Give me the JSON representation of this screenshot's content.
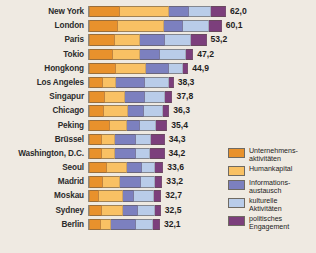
{
  "chart_data": {
    "type": "bar",
    "orientation": "horizontal",
    "stacked": true,
    "title": "",
    "subtitle": "",
    "xlabel": "",
    "ylabel": "",
    "grid": false,
    "xlim": [
      0,
      62
    ],
    "legend_position": "right",
    "value_format": "comma-decimal",
    "categories": [
      "New York",
      "London",
      "Paris",
      "Tokio",
      "Hongkong",
      "Los Angeles",
      "Singapur",
      "Chicago",
      "Peking",
      "Brüssel",
      "Washington, D.C.",
      "Seoul",
      "Madrid",
      "Moskau",
      "Sydney",
      "Berlin"
    ],
    "totals": [
      62.0,
      60.1,
      53.2,
      47.2,
      44.9,
      38.3,
      37.8,
      36.3,
      35.4,
      34.3,
      34.2,
      33.6,
      33.2,
      32.7,
      32.5,
      32.1
    ],
    "total_labels": [
      "62,0",
      "60,1",
      "53,2",
      "47,2",
      "44,9",
      "38,3",
      "37,8",
      "36,3",
      "35,4",
      "34,3",
      "34,2",
      "33,6",
      "33,2",
      "32,7",
      "32,5",
      "32,1"
    ],
    "series": [
      {
        "name": "Unternehmens-\naktivitäten",
        "color": "#e8912c",
        "values": [
          14.2,
          13.0,
          11.6,
          10.8,
          12.0,
          6.4,
          7.2,
          7.0,
          9.3,
          5.9,
          5.8,
          8.1,
          6.4,
          4.6,
          5.7,
          5.6
        ]
      },
      {
        "name": "Humankapital",
        "color": "#f9c164",
        "values": [
          21.9,
          21.1,
          11.4,
          12.3,
          13.9,
          5.9,
          9.3,
          10.5,
          7.7,
          5.7,
          6.0,
          9.1,
          7.5,
          10.8,
          9.5,
          4.3
        ]
      },
      {
        "name": "Informations-\naustausch",
        "color": "#7c80bf",
        "values": [
          9.1,
          8.3,
          11.6,
          9.0,
          10.3,
          13.1,
          9.0,
          7.3,
          5.9,
          9.5,
          9.6,
          6.6,
          9.5,
          5.1,
          7.1,
          11.2
        ]
      },
      {
        "name": "kulturelle\nAktivitäten",
        "color": "#b9cce9",
        "values": [
          10.2,
          12.1,
          11.4,
          11.6,
          6.4,
          11.0,
          9.1,
          8.5,
          7.3,
          7.0,
          6.2,
          6.0,
          6.4,
          9.0,
          7.5,
          8.0
        ]
      },
      {
        "name": "politisches\nEngagement",
        "color": "#7c3f7c",
        "values": [
          6.6,
          5.6,
          7.2,
          3.5,
          2.3,
          1.9,
          3.2,
          3.0,
          5.2,
          6.2,
          6.6,
          3.8,
          3.4,
          3.2,
          2.7,
          3.0
        ]
      }
    ],
    "legend": [
      {
        "label": "Unternehmens-\naktivitäten",
        "color": "#e8912c"
      },
      {
        "label": "Humankapital",
        "color": "#f9c164"
      },
      {
        "label": "Informations-\naustausch",
        "color": "#7c80bf"
      },
      {
        "label": "kulturelle\nAktivitäten",
        "color": "#b9cce9"
      },
      {
        "label": "politisches\nEngagement",
        "color": "#7c3f7c"
      }
    ]
  }
}
